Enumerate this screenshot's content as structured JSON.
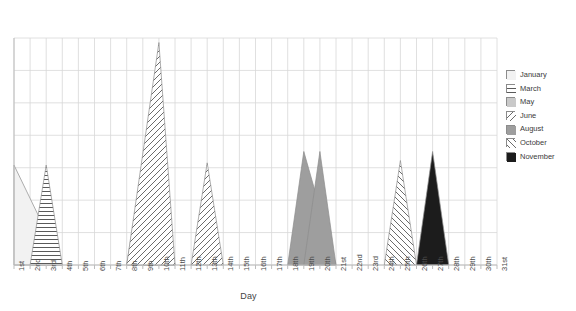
{
  "chart_data": {
    "type": "area",
    "title": "",
    "subtitle": "",
    "xlabel": "Day",
    "ylabel": "",
    "grid": true,
    "legend_position": "right",
    "x": [
      "1st",
      "2nd",
      "3rd",
      "4th",
      "5th",
      "6th",
      "7th",
      "8th",
      "9th",
      "10th",
      "11th",
      "12th",
      "13th",
      "14th",
      "15th",
      "16th",
      "17th",
      "18th",
      "19th",
      "20th",
      "21st",
      "22nd",
      "23rd",
      "24th",
      "25th",
      "26th",
      "27th",
      "28th",
      "29th",
      "30th",
      "31st"
    ],
    "xlim": [
      1,
      31
    ],
    "ylim": [
      0,
      100
    ],
    "series": [
      {
        "name": "January",
        "peak_day": "1st",
        "peak_value": 44,
        "left_day": "1st",
        "right_day": "4th",
        "fill": "#f2f2f2",
        "pattern": "solid-light"
      },
      {
        "name": "March",
        "peak_day": "3rd",
        "peak_value": 44,
        "left_day": "2nd",
        "right_day": "4th",
        "fill": "#ffffff",
        "pattern": "horizontal-lines"
      },
      {
        "name": "March",
        "peak_day": "9th",
        "peak_value": 44,
        "left_day": "8th",
        "right_day": "11th",
        "fill": "#ffffff",
        "pattern": "horizontal-lines"
      },
      {
        "name": "May",
        "peak_day": "10th",
        "peak_value": 44,
        "left_day": "9th",
        "right_day": "11th",
        "fill": "#c9c9c9",
        "pattern": "solid-gray"
      },
      {
        "name": "June",
        "peak_day": "10th",
        "peak_value": 98,
        "left_day": "8th",
        "right_day": "11th",
        "fill": "#ffffff",
        "pattern": "diagonal-forward"
      },
      {
        "name": "June",
        "peak_day": "13th",
        "peak_value": 45,
        "left_day": "12th",
        "right_day": "14th",
        "fill": "#ffffff",
        "pattern": "diagonal-forward"
      },
      {
        "name": "August",
        "peak_day": "19th",
        "peak_value": 50,
        "left_day": "18th",
        "right_day": "21st",
        "fill": "#9e9e9e",
        "pattern": "solid-midgray"
      },
      {
        "name": "August",
        "peak_day": "20th",
        "peak_value": 50,
        "left_day": "19th",
        "right_day": "21st",
        "fill": "#9e9e9e",
        "pattern": "solid-midgray"
      },
      {
        "name": "October",
        "peak_day": "25th",
        "peak_value": 46,
        "left_day": "24th",
        "right_day": "26th",
        "fill": "#ffffff",
        "pattern": "diagonal-back"
      },
      {
        "name": "November",
        "peak_day": "27th",
        "peak_value": 50,
        "left_day": "26th",
        "right_day": "28th",
        "fill": "#1c1c1c",
        "pattern": "solid-black"
      }
    ],
    "legend": [
      {
        "label": "January",
        "pattern": "solid-light",
        "color": "#f2f2f2"
      },
      {
        "label": "March",
        "pattern": "horizontal-lines",
        "color": "#ffffff"
      },
      {
        "label": "May",
        "pattern": "solid-gray",
        "color": "#c9c9c9"
      },
      {
        "label": "June",
        "pattern": "diagonal-forward",
        "color": "#ffffff"
      },
      {
        "label": "August",
        "pattern": "solid-midgray",
        "color": "#9e9e9e"
      },
      {
        "label": "October",
        "pattern": "diagonal-back",
        "color": "#ffffff"
      },
      {
        "label": "November",
        "pattern": "solid-black",
        "color": "#1c1c1c"
      }
    ]
  },
  "axes": {
    "x_title": "Day",
    "tick_labels": [
      "1st",
      "2nd",
      "3rd",
      "4th",
      "5th",
      "6th",
      "7th",
      "8th",
      "9th",
      "10th",
      "11th",
      "12th",
      "13th",
      "14th",
      "15th",
      "16th",
      "17th",
      "18th",
      "19th",
      "20th",
      "21st",
      "22nd",
      "23rd",
      "24th",
      "25th",
      "26th",
      "27th",
      "28th",
      "29th",
      "30th",
      "31st"
    ]
  },
  "colors": {
    "grid": "#d8d8d8",
    "axis": "#bdbdbd",
    "text": "#4a4a4a",
    "outline": "#8c8c8c"
  }
}
